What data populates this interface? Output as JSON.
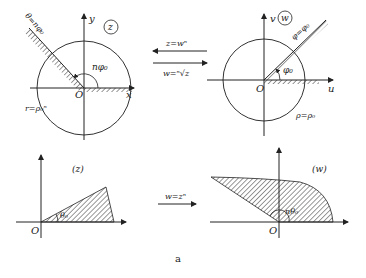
{
  "figure": {
    "caption": "a",
    "top_left": {
      "plane_label": "z",
      "x_axis": "x",
      "y_axis": "y",
      "origin": "O",
      "ray_label": "θ=nφ₀",
      "angle_label": "nφ₀",
      "circle_label": "r=ρ₀ⁿ"
    },
    "top_right": {
      "plane_label": "w",
      "u_axis": "u",
      "v_axis": "v",
      "origin": "O",
      "ray_label": "φ=φ₀",
      "angle_label": "φ₀",
      "circle_label": "ρ=ρ₀"
    },
    "top_arrows": {
      "forward_label": "z=wⁿ",
      "inverse_label": "w=ⁿ√z"
    },
    "bottom_left": {
      "plane_label": "(z)",
      "origin": "O",
      "angle_label": "θ₀"
    },
    "bottom_right": {
      "plane_label": "(w)",
      "origin": "O",
      "angle_label": "nθ₀"
    },
    "bottom_arrow": {
      "label": "w=zⁿ"
    }
  }
}
